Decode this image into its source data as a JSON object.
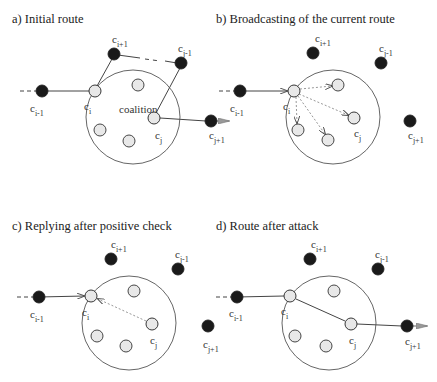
{
  "colors": {
    "dark_node": "#1a1a1a",
    "light_node": "#e8e8e8",
    "line": "#333333",
    "dotted": "#888888"
  },
  "panels": [
    {
      "id": "a",
      "title": "a) Initial route",
      "coalition_label": "coalition",
      "nodes": [
        {
          "name": "c",
          "sub": "i-1",
          "type": "dark",
          "x": 42,
          "y": 91,
          "lx": 30,
          "ly": 112
        },
        {
          "name": "c",
          "sub": "i",
          "type": "light",
          "x": 95,
          "y": 91,
          "lx": 84,
          "ly": 110
        },
        {
          "name": "c",
          "sub": "i+1",
          "type": "dark",
          "x": 114,
          "y": 54,
          "lx": 112,
          "ly": 43
        },
        {
          "name": "c",
          "sub": "j-1",
          "type": "dark",
          "x": 181,
          "y": 63,
          "lx": 178,
          "ly": 52
        },
        {
          "name": "c",
          "sub": "j",
          "type": "light",
          "x": 154,
          "y": 118,
          "lx": 155,
          "ly": 139
        },
        {
          "name": "c",
          "sub": "j+1",
          "type": "dark",
          "x": 211,
          "y": 121,
          "lx": 209,
          "ly": 139
        }
      ],
      "inner_nodes": [
        [
          138,
          85
        ],
        [
          100,
          130
        ],
        [
          129,
          141
        ]
      ],
      "circle": {
        "cx": 133,
        "cy": 117,
        "r": 47
      }
    },
    {
      "id": "b",
      "title": "b) Broadcasting of the current route",
      "nodes": [
        {
          "name": "c",
          "sub": "i-1",
          "type": "dark",
          "x": 240,
          "y": 91,
          "lx": 230,
          "ly": 112
        },
        {
          "name": "c",
          "sub": "i",
          "type": "light",
          "x": 294,
          "y": 91,
          "lx": 283,
          "ly": 110
        },
        {
          "name": "c",
          "sub": "i+1",
          "type": "dark",
          "x": 313,
          "y": 53,
          "lx": 315,
          "ly": 42
        },
        {
          "name": "c",
          "sub": "j-1",
          "type": "dark",
          "x": 381,
          "y": 63,
          "lx": 379,
          "ly": 52
        },
        {
          "name": "c",
          "sub": "j",
          "type": "light",
          "x": 354,
          "y": 118,
          "lx": 354,
          "ly": 137
        },
        {
          "name": "c",
          "sub": "j+1",
          "type": "dark",
          "x": 410,
          "y": 121,
          "lx": 408,
          "ly": 139
        }
      ],
      "inner_nodes": [
        [
          338,
          85
        ],
        [
          298,
          130
        ],
        [
          328,
          140
        ]
      ],
      "circle": {
        "cx": 333,
        "cy": 117,
        "r": 47
      }
    },
    {
      "id": "c",
      "title": "c) Replying after positive check",
      "nodes": [
        {
          "name": "c",
          "sub": "i-1",
          "type": "dark",
          "x": 39,
          "y": 297,
          "lx": 30,
          "ly": 318
        },
        {
          "name": "c",
          "sub": "i",
          "type": "light",
          "x": 91,
          "y": 296,
          "lx": 82,
          "ly": 316
        },
        {
          "name": "c",
          "sub": "i+1",
          "type": "dark",
          "x": 111,
          "y": 259,
          "lx": 111,
          "ly": 248
        },
        {
          "name": "c",
          "sub": "j-1",
          "type": "dark",
          "x": 178,
          "y": 269,
          "lx": 175,
          "ly": 258
        },
        {
          "name": "c",
          "sub": "j",
          "type": "light",
          "x": 152,
          "y": 324,
          "lx": 150,
          "ly": 344
        },
        {
          "name": "c",
          "sub": "j+1",
          "type": "dark",
          "x": 208,
          "y": 326,
          "lx": 203,
          "ly": 348
        }
      ],
      "inner_nodes": [
        [
          134,
          291
        ],
        [
          97,
          336
        ],
        [
          126,
          346
        ]
      ],
      "circle": {
        "cx": 129,
        "cy": 323,
        "r": 47
      }
    },
    {
      "id": "d",
      "title": "d) Route after attack",
      "nodes": [
        {
          "name": "c",
          "sub": "i-1",
          "type": "dark",
          "x": 237,
          "y": 297,
          "lx": 229,
          "ly": 317
        },
        {
          "name": "c",
          "sub": "i",
          "type": "light",
          "x": 290,
          "y": 296,
          "lx": 281,
          "ly": 315
        },
        {
          "name": "c",
          "sub": "i+1",
          "type": "dark",
          "x": 310,
          "y": 259,
          "lx": 311,
          "ly": 248
        },
        {
          "name": "c",
          "sub": "j-1",
          "type": "dark",
          "x": 378,
          "y": 269,
          "lx": 375,
          "ly": 258
        },
        {
          "name": "c",
          "sub": "j",
          "type": "light",
          "x": 351,
          "y": 324,
          "lx": 349,
          "ly": 344
        },
        {
          "name": "c",
          "sub": "j+1",
          "type": "dark",
          "x": 407,
          "y": 326,
          "lx": 405,
          "ly": 345
        }
      ],
      "inner_nodes": [
        [
          334,
          291
        ],
        [
          295,
          336
        ],
        [
          326,
          346
        ]
      ],
      "circle": {
        "cx": 329,
        "cy": 323,
        "r": 47
      }
    }
  ]
}
